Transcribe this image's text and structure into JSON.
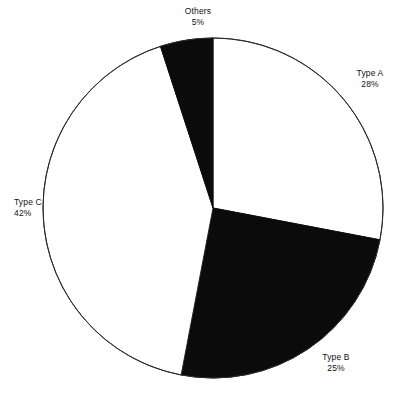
{
  "chart_data": {
    "type": "pie",
    "title": "",
    "categories": [
      "Type A",
      "Type B",
      "Type C",
      "Others"
    ],
    "values": [
      28,
      25,
      42,
      5
    ],
    "value_unit": "%",
    "labels": [
      {
        "name": "Type A",
        "pct": "28%",
        "value": 28,
        "color": "#ffffff"
      },
      {
        "name": "Type B",
        "pct": "25%",
        "value": 25,
        "color": "#0b0b0b"
      },
      {
        "name": "Type C",
        "pct": "42%",
        "value": 42,
        "color": "#ffffff"
      },
      {
        "name": "Others",
        "pct": "5%",
        "value": 5,
        "color": "#0b0b0b"
      }
    ],
    "start_angle_deg": 0,
    "direction": "clockwise",
    "legend": "none",
    "grid": false,
    "colors": {
      "fill_light": "#ffffff",
      "fill_dark": "#0b0b0b",
      "outline": "#2b2b2b",
      "text": "#111111",
      "background": "#ffffff"
    }
  },
  "header": {
    "cropped_title": ""
  }
}
